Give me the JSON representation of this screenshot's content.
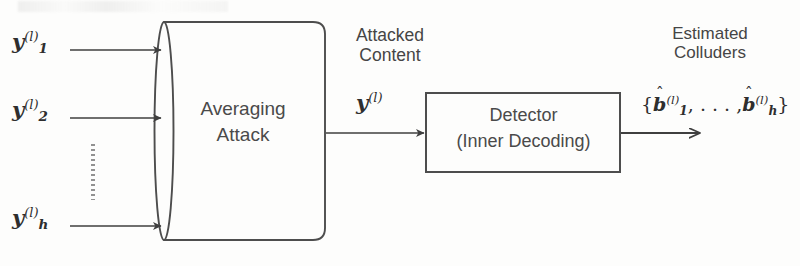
{
  "diagram": {
    "background_color": "#fdfdfc",
    "stroke_color": "#4a4a4a",
    "text_color": "#454545"
  },
  "inputs": [
    {
      "name": "input-1",
      "symbol": "y",
      "subscript": "1",
      "superscript": "(l)"
    },
    {
      "name": "input-2",
      "symbol": "y",
      "subscript": "2",
      "superscript": "(l)"
    },
    {
      "name": "input-h",
      "symbol": "y",
      "subscript": "h",
      "superscript": "(l)"
    }
  ],
  "ellipsis": {
    "style": "vertical-dotted"
  },
  "cylinder": {
    "label_line1": "Averaging",
    "label_line2": "Attack"
  },
  "middle_signal": {
    "caption_line1": "Attacked",
    "caption_line2": "Content",
    "symbol": "y",
    "superscript": "(l)"
  },
  "detector": {
    "label_line1": "Detector",
    "label_line2": "(Inner Decoding)"
  },
  "output": {
    "caption_line1": "Estimated",
    "caption_line2": "Colluders",
    "open_brace": "{",
    "symbol_first": "b",
    "subscript_first": "1",
    "superscript_first": "(l)",
    "separator": ", . . . ,",
    "symbol_last": "b",
    "subscript_last": "h",
    "superscript_last": "(l)",
    "close_brace": "}",
    "accent": "ˆ"
  }
}
